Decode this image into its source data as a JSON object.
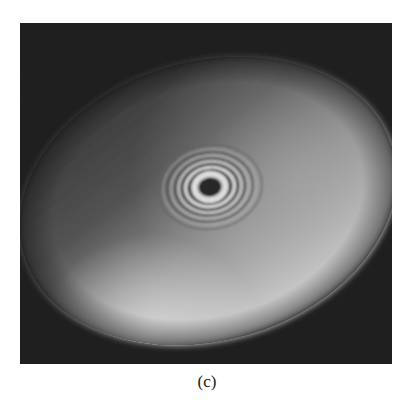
{
  "figure": {
    "panel_label": "(c)",
    "image_description": "Interference fringe pattern: concentric rings centered on a dark spot inside a tilted, unevenly illuminated elliptical field on a black background",
    "colors": {
      "background": "#0b0b0b",
      "field_dim": "#3a3a3a",
      "field_bright": "#d8d8d8",
      "ring_bright": "#f2f2f2",
      "center_dark": "#151515"
    }
  }
}
